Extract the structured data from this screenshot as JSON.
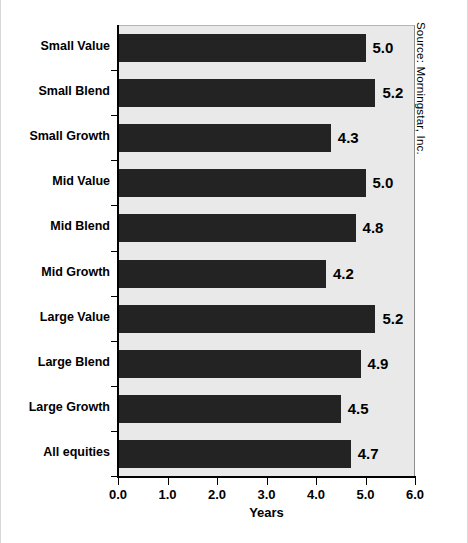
{
  "chart_data": {
    "type": "bar",
    "orientation": "horizontal",
    "title": "",
    "xlabel": "Years",
    "ylabel": "",
    "xlim": [
      0.0,
      6.0
    ],
    "xticks": [
      "0.0",
      "1.0",
      "2.0",
      "3.0",
      "4.0",
      "5.0",
      "6.0"
    ],
    "grid": false,
    "legend": null,
    "categories": [
      "Small Value",
      "Small Blend",
      "Small Growth",
      "Mid Value",
      "Mid Blend",
      "Mid Growth",
      "Large Value",
      "Large Blend",
      "Large Growth",
      "All equities"
    ],
    "values": [
      5.0,
      5.2,
      4.3,
      5.0,
      4.8,
      4.2,
      5.2,
      4.9,
      4.5,
      4.7
    ],
    "value_labels": [
      "5.0",
      "5.2",
      "4.3",
      "5.0",
      "4.8",
      "4.2",
      "5.2",
      "4.9",
      "4.5",
      "4.7"
    ],
    "bar_color": "#232323",
    "plot_background": "#e9e9e9"
  },
  "annotations": {
    "source": "Source: Morningstar, Inc."
  }
}
